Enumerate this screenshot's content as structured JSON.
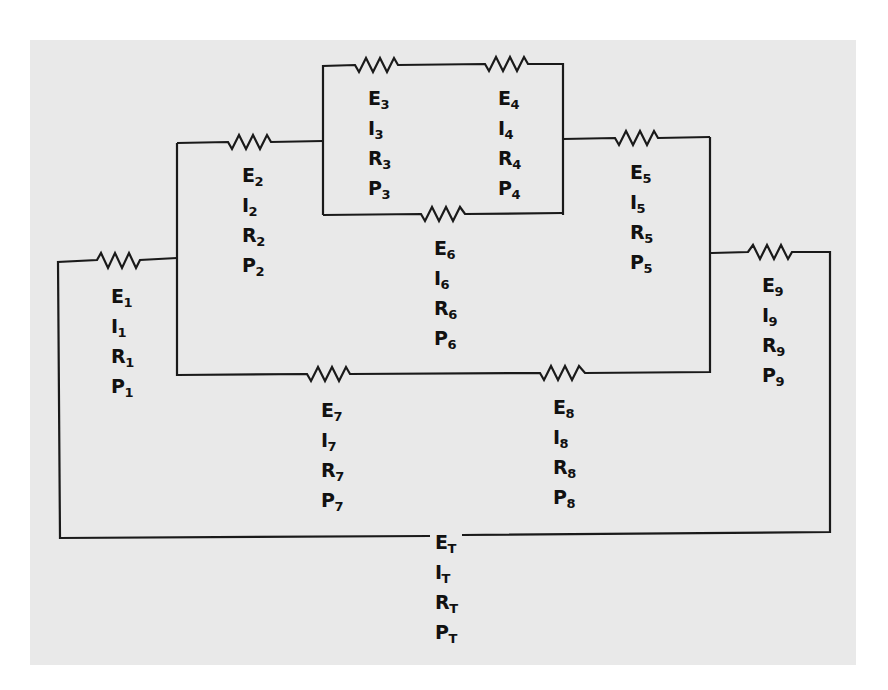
{
  "diagram": {
    "type": "series-parallel resistor circuit",
    "background_color": "#e9e9e9",
    "wire_color": "#1a1a1a",
    "components": [
      {
        "id": "R1",
        "lines": [
          {
            "q": "E",
            "s": "1"
          },
          {
            "q": "I",
            "s": "1"
          },
          {
            "q": "R",
            "s": "1"
          },
          {
            "q": "P",
            "s": "1"
          }
        ]
      },
      {
        "id": "R2",
        "lines": [
          {
            "q": "E",
            "s": "2"
          },
          {
            "q": "I",
            "s": "2"
          },
          {
            "q": "R",
            "s": "2"
          },
          {
            "q": "P",
            "s": "2"
          }
        ]
      },
      {
        "id": "R3",
        "lines": [
          {
            "q": "E",
            "s": "3"
          },
          {
            "q": "I",
            "s": "3"
          },
          {
            "q": "R",
            "s": "3"
          },
          {
            "q": "P",
            "s": "3"
          }
        ]
      },
      {
        "id": "R4",
        "lines": [
          {
            "q": "E",
            "s": "4"
          },
          {
            "q": "I",
            "s": "4"
          },
          {
            "q": "R",
            "s": "4"
          },
          {
            "q": "P",
            "s": "4"
          }
        ]
      },
      {
        "id": "R5",
        "lines": [
          {
            "q": "E",
            "s": "5"
          },
          {
            "q": "I",
            "s": "5"
          },
          {
            "q": "R",
            "s": "5"
          },
          {
            "q": "P",
            "s": "5"
          }
        ]
      },
      {
        "id": "R6",
        "lines": [
          {
            "q": "E",
            "s": "6"
          },
          {
            "q": "I",
            "s": "6"
          },
          {
            "q": "R",
            "s": "6"
          },
          {
            "q": "P",
            "s": "6"
          }
        ]
      },
      {
        "id": "R7",
        "lines": [
          {
            "q": "E",
            "s": "7"
          },
          {
            "q": "I",
            "s": "7"
          },
          {
            "q": "R",
            "s": "7"
          },
          {
            "q": "P",
            "s": "7"
          }
        ]
      },
      {
        "id": "R8",
        "lines": [
          {
            "q": "E",
            "s": "8"
          },
          {
            "q": "I",
            "s": "8"
          },
          {
            "q": "R",
            "s": "8"
          },
          {
            "q": "P",
            "s": "8"
          }
        ]
      },
      {
        "id": "R9",
        "lines": [
          {
            "q": "E",
            "s": "9"
          },
          {
            "q": "I",
            "s": "9"
          },
          {
            "q": "R",
            "s": "9"
          },
          {
            "q": "P",
            "s": "9"
          }
        ]
      }
    ],
    "total": {
      "id": "T",
      "lines": [
        {
          "q": "E",
          "s": "T"
        },
        {
          "q": "I",
          "s": "T"
        },
        {
          "q": "R",
          "s": "T"
        },
        {
          "q": "P",
          "s": "T"
        }
      ]
    }
  }
}
